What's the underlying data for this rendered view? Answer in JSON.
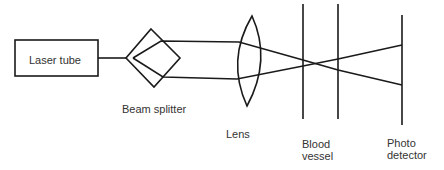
{
  "diagram": {
    "laser_tube": {
      "label": "Laser tube"
    },
    "beam_splitter": {
      "label": "Beam splitter"
    },
    "lens": {
      "label": "Lens"
    },
    "blood_vessel": {
      "label_line1": "Blood",
      "label_line2": "vessel"
    },
    "photo_detector": {
      "label_line1": "Photo",
      "label_line2": "detector"
    }
  },
  "colors": {
    "stroke": "#1a1a1a",
    "text": "#333333"
  }
}
